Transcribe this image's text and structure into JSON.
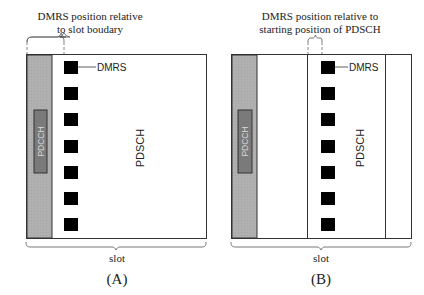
{
  "panels": [
    {
      "id": "A",
      "caption": "(A)",
      "annotation_line1": "DMRS position relative",
      "annotation_line2": "to slot boudary",
      "pdcch_label": "PDCCH",
      "pdsch_label": "PDSCH",
      "dmrs_label": "DMRS",
      "slot_label": "slot",
      "dmrs_count": 7
    },
    {
      "id": "B",
      "caption": "(B)",
      "annotation_line1": "DMRS position relative to",
      "annotation_line2": "starting position of PDSCH",
      "pdcch_label": "PDCCH",
      "pdsch_label": "PDSCH",
      "dmrs_label": "DMRS",
      "slot_label": "slot",
      "dmrs_count": 7
    }
  ],
  "colors": {
    "outline": "#333333",
    "pdcch_region": "#b0b0b0",
    "pdcch_box": "#7a7a7a",
    "dmrs": "#000000",
    "background": "#ffffff"
  }
}
